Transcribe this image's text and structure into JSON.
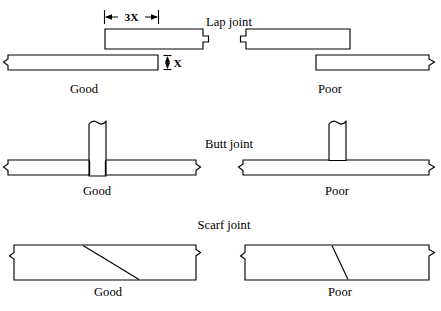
{
  "figure": {
    "background_color": "#ffffff",
    "line_color": "#000000",
    "fill_color": "#ffffff"
  },
  "sections": [
    {
      "id": "lap-joint",
      "title": "Lap joint",
      "good_label": "Good",
      "poor_label": "Poor",
      "dimensions": {
        "overlap_label": "3X",
        "thickness_label": "X"
      }
    },
    {
      "id": "butt-joint",
      "title": "Butt joint",
      "good_label": "Good",
      "poor_label": "Poor"
    },
    {
      "id": "scarf-joint",
      "title": "Scarf joint",
      "good_label": "Good",
      "poor_label": "Poor"
    }
  ]
}
